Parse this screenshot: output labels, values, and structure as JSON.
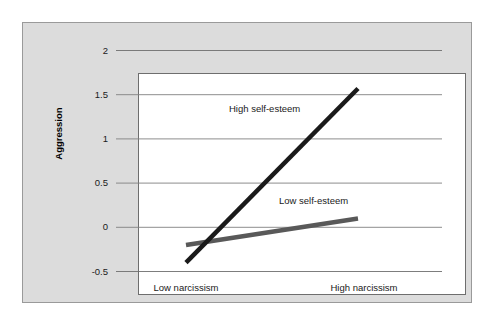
{
  "chart_data": {
    "type": "line",
    "title": "",
    "subtitle": "",
    "xlabel": "",
    "ylabel": "Aggression",
    "grid": true,
    "legend_position": "inline-annotations",
    "x": [
      "Low narcissism",
      "High narcissism"
    ],
    "xtick_labels": [
      "Low narcissism",
      "High narcissism"
    ],
    "ytick_labels": [
      "2",
      "1.5",
      "1",
      "0.5",
      "0",
      "-0.5"
    ],
    "ytick_values": [
      2,
      1.5,
      1,
      0.5,
      0,
      -0.5
    ],
    "ylim": [
      -0.5,
      2
    ],
    "series": [
      {
        "name": "High self-esteem",
        "values": [
          -0.4,
          1.57
        ],
        "color": "#1a1a1a",
        "width": 4.5
      },
      {
        "name": "Low self-esteem",
        "values": [
          -0.2,
          0.1
        ],
        "color": "#595959",
        "width": 4.5
      }
    ],
    "annotations": [
      {
        "text": "High self-esteem",
        "x": 0.35,
        "y": 1.18
      },
      {
        "text": "Low self-esteem",
        "x": 0.62,
        "y": 0.22
      }
    ]
  },
  "axes": {
    "y_title": "Aggression",
    "y_ticks": [
      {
        "label": "2",
        "value": 2
      },
      {
        "label": "1.5",
        "value": 1.5
      },
      {
        "label": "1",
        "value": 1
      },
      {
        "label": "0.5",
        "value": 0.5
      },
      {
        "label": "0",
        "value": 0
      },
      {
        "label": "-0.5",
        "value": -0.5
      }
    ],
    "x_ticks": [
      {
        "label": "Low narcissism"
      },
      {
        "label": "High narcissism"
      }
    ]
  },
  "series_labels": {
    "high": "High self-esteem",
    "low": "Low self-esteem"
  },
  "colors": {
    "panel_background": "#dcdcdc",
    "plot_background": "#ffffff",
    "panel_border": "#9a9a9a",
    "plot_border": "#6e6e6e",
    "gridline": "#808080",
    "high_self_esteem_line": "#1a1a1a",
    "low_self_esteem_line": "#595959",
    "text": "#1a1a1a"
  }
}
